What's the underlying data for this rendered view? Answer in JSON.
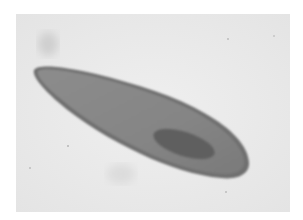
{
  "image": {
    "subject": "micrograph of an elongated single-celled organism (paramecium-like)",
    "colors": {
      "border": "#ffffff",
      "background": "#ececec",
      "cell_body": "#8a8a8a",
      "cell_edge": "#6e6e6e",
      "nucleus": "#5e5e5e"
    }
  }
}
